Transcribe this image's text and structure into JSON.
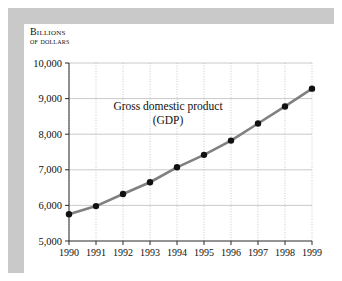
{
  "figure": {
    "axis_caption_line_1": "Billions",
    "axis_caption_line_2": "of dollars",
    "frame_color": "#c9c9c9",
    "panel_color": "#ffffff"
  },
  "chart_data": {
    "type": "line",
    "title": "",
    "annotation_line_1": "Gross domestic product",
    "annotation_line_2": "(GDP)",
    "xlabel": "",
    "ylabel": "Billions of dollars",
    "categories": [
      "1990",
      "1991",
      "1992",
      "1993",
      "1994",
      "1995",
      "1996",
      "1997",
      "1998",
      "1999"
    ],
    "values": [
      5750,
      5980,
      6320,
      6650,
      7070,
      7420,
      7820,
      8300,
      8780,
      9280
    ],
    "ylim": [
      5000,
      10000
    ],
    "ytick_values": [
      5000,
      6000,
      7000,
      8000,
      9000,
      10000
    ],
    "ytick_labels": [
      "5,000",
      "6,000",
      "7,000",
      "8,000",
      "9,000",
      "10,000"
    ],
    "xtick_labels": [
      "1990",
      "1991",
      "1992",
      "1993",
      "1994",
      "1995",
      "1996",
      "1997",
      "1998",
      "1999"
    ],
    "grid": {
      "horizontal": true,
      "vertical": true,
      "horizontal_style": "solid",
      "vertical_style": "dotted",
      "color": "#bdbdbd"
    },
    "legend": "none",
    "series": [
      {
        "name": "Gross domestic product (GDP)",
        "line_color": "#808080",
        "marker_color": "#111111",
        "marker": "circle",
        "values": [
          5750,
          5980,
          6320,
          6650,
          7070,
          7420,
          7820,
          8300,
          8780,
          9280
        ]
      }
    ]
  }
}
